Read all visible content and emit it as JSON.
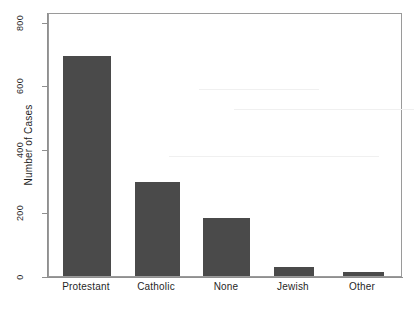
{
  "chart_data": {
    "type": "bar",
    "title": "",
    "xlabel": "",
    "ylabel": "Number of Cases",
    "categories": [
      "Protestant",
      "Catholic",
      "None",
      "Jewish",
      "Other"
    ],
    "values": [
      668,
      287,
      177,
      28,
      13
    ],
    "ylim": [
      0,
      800
    ],
    "yticks": [
      0,
      200,
      400,
      600,
      800
    ],
    "ytick_labels": [
      "0",
      "200",
      "400",
      "600",
      "800"
    ],
    "grid": false,
    "legend": null,
    "bar_color": "#4a4a4a",
    "axis_color": "#8f8f8f",
    "background_color": "#ffffff",
    "series": [
      {
        "name": "Number of Cases",
        "values": [
          668,
          287,
          177,
          28,
          13
        ]
      }
    ]
  },
  "axes": {
    "y_title": "Number of Cases",
    "y_labels": [
      "0",
      "200",
      "400",
      "600",
      "800"
    ],
    "x_labels": [
      "Protestant",
      "Catholic",
      "None",
      "Jewish",
      "Other"
    ]
  }
}
